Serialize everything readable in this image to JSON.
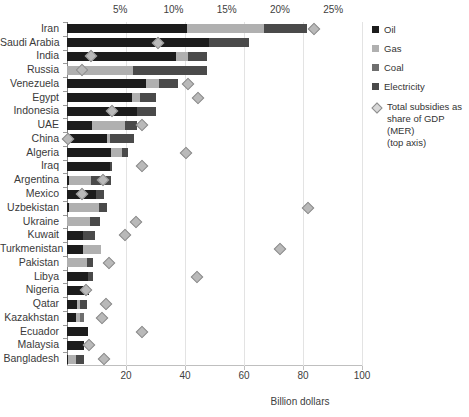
{
  "chart_data": {
    "type": "bar",
    "orientation": "horizontal",
    "stacked": true,
    "title": "",
    "xlabel": "Billion dollars",
    "ylabel": "",
    "xlim": [
      0,
      100
    ],
    "xticks": [
      20,
      40,
      60,
      80,
      100
    ],
    "xticklabels": [
      "20",
      "40",
      "60",
      "80",
      "100"
    ],
    "top_axis": {
      "label": "Total subsidies as share of GDP (MER)",
      "lim": [
        0,
        27.7
      ],
      "ticks": [
        5,
        10,
        15,
        20,
        25
      ],
      "ticklabels": [
        "5%",
        "10%",
        "15%",
        "20%",
        "25%"
      ]
    },
    "grid": "vertical",
    "legend_position": "right",
    "categories": [
      "Iran",
      "Saudi Arabia",
      "India",
      "Russia",
      "Venezuela",
      "Egypt",
      "Indonesia",
      "UAE",
      "China",
      "Algeria",
      "Iraq",
      "Argentina",
      "Mexico",
      "Uzbekistan",
      "Ukraine",
      "Kuwait",
      "Turkmenistan",
      "Pakistan",
      "Libya",
      "Nigeria",
      "Qatar",
      "Kazakhstan",
      "Ecuador",
      "Malaysia",
      "Bangladesh"
    ],
    "series": [
      {
        "name": "Oil",
        "color": "#1c1c1c",
        "values": [
          40.6,
          48.1,
          36.9,
          0.0,
          26.8,
          22.0,
          23.7,
          8.5,
          13.6,
          14.9,
          14.6,
          0.6,
          9.8,
          0.7,
          0.0,
          5.4,
          5.4,
          0.0,
          7.1,
          7.5,
          3.4,
          3.1,
          7.1,
          5.8,
          0.5
        ]
      },
      {
        "name": "Gas",
        "color": "#b0b0b0",
        "values": [
          26.1,
          0.0,
          4.1,
          22.4,
          4.4,
          2.7,
          0.0,
          11.2,
          1.0,
          3.7,
          0.0,
          7.5,
          0.0,
          10.2,
          7.8,
          0.0,
          6.1,
          6.8,
          0.0,
          0.0,
          1.0,
          1.3,
          0.0,
          0.0,
          2.7
        ]
      },
      {
        "name": "Coal",
        "color": "#6e6e6e",
        "values": [
          0.0,
          0.0,
          0.0,
          0.0,
          0.0,
          0.0,
          0.0,
          0.0,
          0.0,
          0.0,
          0.0,
          0.0,
          0.0,
          0.0,
          0.0,
          0.0,
          0.0,
          0.0,
          0.0,
          0.0,
          0.0,
          1.4,
          0.0,
          0.0,
          0.0
        ]
      },
      {
        "name": "Electricity",
        "color": "#4a4a4a",
        "values": [
          14.6,
          13.6,
          6.4,
          25.1,
          6.4,
          5.4,
          6.4,
          4.1,
          8.1,
          2.0,
          0.7,
          6.8,
          2.7,
          2.7,
          3.4,
          4.1,
          0.0,
          2.0,
          1.7,
          0.0,
          2.4,
          0.0,
          0.0,
          0.0,
          2.4
        ]
      }
    ],
    "diamond_series": {
      "name": "Total subsidies as share of GDP (MER)",
      "unit": "%",
      "values": [
        23.2,
        8.5,
        2.3,
        1.4,
        11.4,
        12.3,
        4.2,
        7.0,
        0.1,
        11.2,
        7.0,
        3.4,
        1.4,
        22.6,
        6.5,
        5.4,
        20.0,
        3.9,
        12.2,
        1.8,
        3.7,
        3.3,
        7.0,
        2.1,
        3.5
      ]
    }
  },
  "legend": {
    "items": [
      {
        "label": "Oil",
        "type": "swatch",
        "key": "oil"
      },
      {
        "label": "Gas",
        "type": "swatch",
        "key": "gas"
      },
      {
        "label": "Coal",
        "type": "swatch",
        "key": "coal"
      },
      {
        "label": "Electricity",
        "type": "swatch",
        "key": "elec"
      }
    ],
    "marker_line1": "Total subsidies as",
    "marker_line2": "share of GDP (MER)",
    "marker_line3": "(top axis)"
  }
}
